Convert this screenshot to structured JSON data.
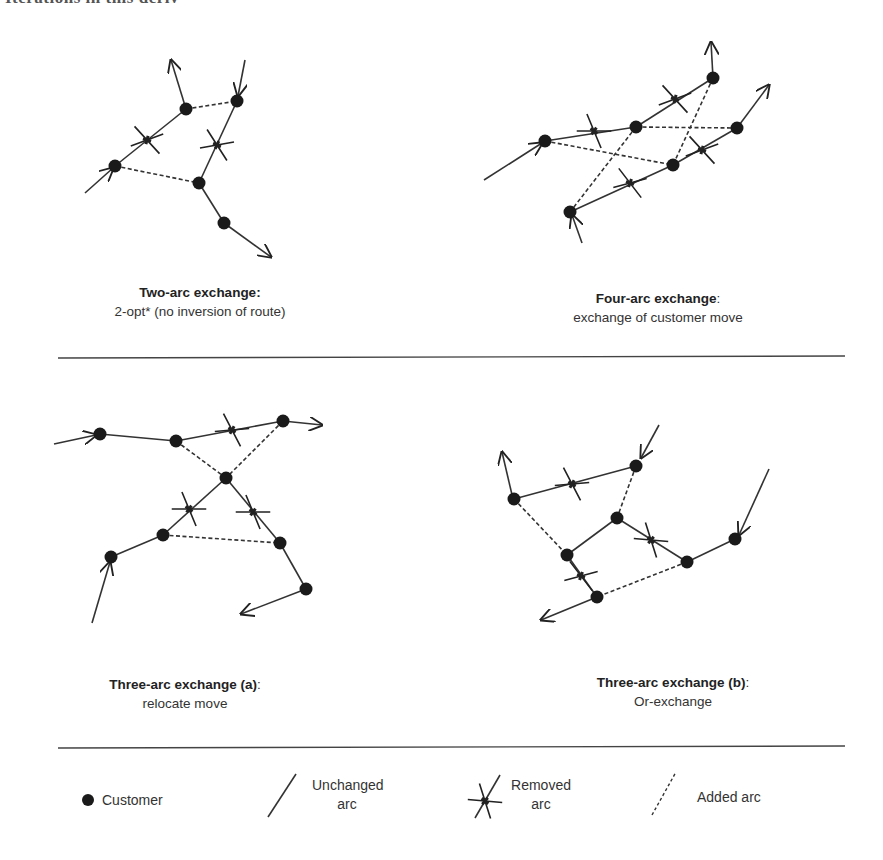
{
  "header_fragment": "Iterations in this deriv",
  "panels": [
    {
      "id": "two-arc",
      "title": "Two-arc exchange:",
      "title_suffix": "",
      "subtitle": "2-opt* (no inversion of route)"
    },
    {
      "id": "four-arc",
      "title": "Four-arc exchange",
      "title_suffix": ":",
      "subtitle": "exchange of customer move"
    },
    {
      "id": "three-arc-a",
      "title": "Three-arc exchange (a)",
      "title_suffix": ":",
      "subtitle": "relocate move"
    },
    {
      "id": "three-arc-b",
      "title": "Three-arc exchange (b)",
      "title_suffix": ":",
      "subtitle": "Or-exchange"
    }
  ],
  "legend": {
    "customer": "Customer",
    "unchanged_1": "Unchanged",
    "unchanged_2": "arc",
    "removed_1": "Removed",
    "removed_2": "arc",
    "added": "Added arc"
  },
  "colors": {
    "ink": "#222222",
    "line": "#333333"
  }
}
